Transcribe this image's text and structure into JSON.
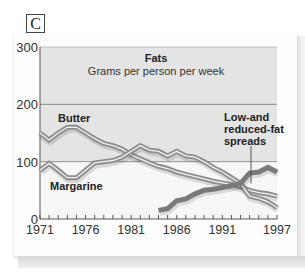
{
  "panel": {
    "letter": "C"
  },
  "chart_data": {
    "type": "line",
    "title": "Fats",
    "subtitle": "Grams per person per week",
    "xlabel": "",
    "ylabel": "",
    "ylim": [
      0,
      300
    ],
    "xlim": [
      1971,
      1997
    ],
    "y_ticks": [
      "0",
      "100",
      "200",
      "300"
    ],
    "x_ticks": [
      "1971",
      "1976",
      "1981",
      "1986",
      "1991",
      "1997"
    ],
    "grid": "horizontal lines at 100 and 200",
    "background_color": "#e6e6e6",
    "line_color": "#8a8a8a",
    "annotations": [
      "Butter",
      "Margarine",
      "Low-and reduced-fat spreads"
    ],
    "series": [
      {
        "name": "Butter",
        "x": [
          1971,
          1972,
          1973,
          1974,
          1975,
          1976,
          1977,
          1978,
          1979,
          1980,
          1981,
          1982,
          1983,
          1984,
          1985,
          1986,
          1987,
          1988,
          1989,
          1990,
          1991,
          1992,
          1993,
          1994,
          1995,
          1996,
          1997
        ],
        "values": [
          150,
          138,
          150,
          160,
          160,
          150,
          140,
          132,
          128,
          122,
          112,
          105,
          98,
          92,
          88,
          82,
          78,
          74,
          70,
          66,
          63,
          60,
          56,
          50,
          46,
          44,
          40
        ]
      },
      {
        "name": "Margarine",
        "x": [
          1971,
          1972,
          1973,
          1974,
          1975,
          1976,
          1977,
          1978,
          1979,
          1980,
          1981,
          1982,
          1983,
          1984,
          1985,
          1986,
          1987,
          1988,
          1989,
          1990,
          1991,
          1992,
          1993,
          1994,
          1995,
          1996,
          1997
        ],
        "values": [
          85,
          97,
          85,
          72,
          72,
          85,
          98,
          100,
          102,
          108,
          118,
          128,
          120,
          118,
          110,
          118,
          110,
          108,
          100,
          90,
          82,
          72,
          62,
          40,
          36,
          30,
          20
        ]
      },
      {
        "name": "Low-and reduced-fat spreads",
        "x": [
          1984,
          1985,
          1986,
          1987,
          1988,
          1989,
          1990,
          1991,
          1992,
          1993,
          1994,
          1995,
          1996,
          1997
        ],
        "values": [
          15,
          18,
          32,
          35,
          44,
          50,
          52,
          55,
          58,
          62,
          80,
          82,
          90,
          82
        ]
      }
    ]
  }
}
